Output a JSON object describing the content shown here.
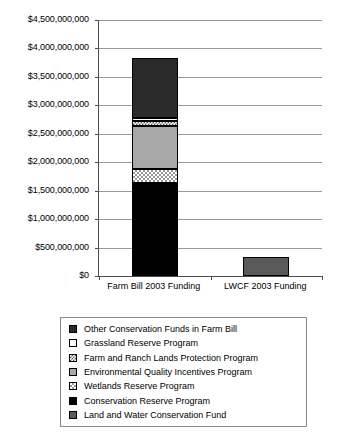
{
  "chart_data": {
    "type": "bar",
    "subtype": "stacked-column",
    "title": "",
    "xlabel": "",
    "ylabel": "",
    "ylim": [
      0,
      4500000000
    ],
    "ytick_step": 500000000,
    "grid": true,
    "legend_position": "bottom",
    "ytick_labels": [
      "$4,500,000,000",
      "$4,000,000,000",
      "$3,500,000,000",
      "$3,000,000,000",
      "$2,500,000,000",
      "$2,000,000,000",
      "$1,500,000,000",
      "$1,000,000,000",
      "$500,000,000",
      "$0"
    ],
    "ytick_values": [
      4500000000,
      4000000000,
      3500000000,
      3000000000,
      2500000000,
      2000000000,
      1500000000,
      1000000000,
      500000000,
      0
    ],
    "categories": [
      "Farm Bill 2003 Funding",
      "LWCF 2003 Funding"
    ],
    "series": [
      {
        "name": "Conservation Reserve Program",
        "swatch": "solid-black",
        "color": "#000000",
        "values": [
          1635000000,
          0
        ]
      },
      {
        "name": "Wetlands Reserve Program",
        "swatch": "checkered-light",
        "color": "#9a9a9a",
        "values": [
          246000000,
          0
        ]
      },
      {
        "name": "Environmental Quality Incentives Program",
        "swatch": "solid-mid-gray",
        "color": "#a8a8a8",
        "values": [
          756000000,
          0
        ]
      },
      {
        "name": "Farm and Ranch Lands Protection Program",
        "swatch": "checkered-dark",
        "color": "#4a4a4a",
        "values": [
          88000000,
          0
        ]
      },
      {
        "name": "Grassland Reserve Program",
        "swatch": "white",
        "color": "#ffffff",
        "values": [
          53000000,
          0
        ]
      },
      {
        "name": "Other Conservation Funds in Farm Bill",
        "swatch": "solid-dark-gray",
        "color": "#2b2b2b",
        "values": [
          1055000000,
          0
        ]
      },
      {
        "name": "Land and Water Conservation Fund",
        "swatch": "solid-medium-gray",
        "color": "#5a5a5a",
        "values": [
          0,
          334000000
        ]
      }
    ],
    "totals": [
      3833000000,
      334000000
    ]
  },
  "legend": {
    "items": [
      {
        "label": "Other Conservation Funds in Farm Bill"
      },
      {
        "label": "Grassland Reserve Program"
      },
      {
        "label": "Farm and Ranch Lands Protection Program"
      },
      {
        "label": "Environmental Quality Incentives Program"
      },
      {
        "label": "Wetlands Reserve Program"
      },
      {
        "label": "Conservation Reserve Program"
      },
      {
        "label": "Land and Water Conservation Fund"
      }
    ]
  }
}
